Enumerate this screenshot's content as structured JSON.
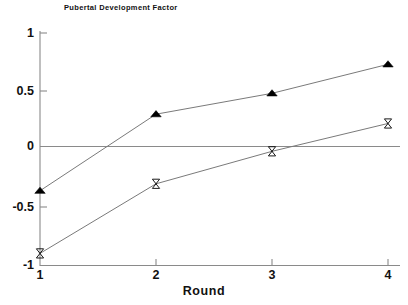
{
  "chart_data": {
    "type": "line",
    "title": "Pubertal Development Factor",
    "xlabel": "Round",
    "ylabel": "",
    "x": [
      1,
      2,
      3,
      4
    ],
    "categories": [
      "1",
      "2",
      "3",
      "4"
    ],
    "xtick_labels": [
      "1",
      "2",
      "3",
      "4"
    ],
    "ytick_labels": [
      "1",
      "0.5",
      "0",
      "-0.5",
      "-1"
    ],
    "ytick_values": [
      1,
      0.5,
      0,
      -0.5,
      -1
    ],
    "xlim": [
      1,
      4
    ],
    "ylim": [
      -1,
      1
    ],
    "grid": false,
    "zero_line": true,
    "legend": null,
    "series": [
      {
        "name": "filled-triangle-series",
        "marker": "triangle-filled",
        "color": "#000000",
        "values": [
          -0.36,
          0.3,
          0.48,
          0.73
        ]
      },
      {
        "name": "open-hourglass-series",
        "marker": "hourglass-open",
        "color": "#000000",
        "values": [
          -0.9,
          -0.3,
          -0.02,
          0.22
        ]
      }
    ]
  },
  "axes": {
    "title": "Pubertal Development Factor",
    "x_label": "Round",
    "y_labels": [
      "1",
      "0.5",
      "0",
      "-0.5",
      "-1"
    ],
    "x_labels": [
      "1",
      "2",
      "3",
      "4"
    ]
  },
  "colors": {
    "axis": "#8a8a8a",
    "line": "#7a7a7a",
    "marker_fill": "#000000",
    "text": "#111111",
    "background": "#ffffff"
  }
}
